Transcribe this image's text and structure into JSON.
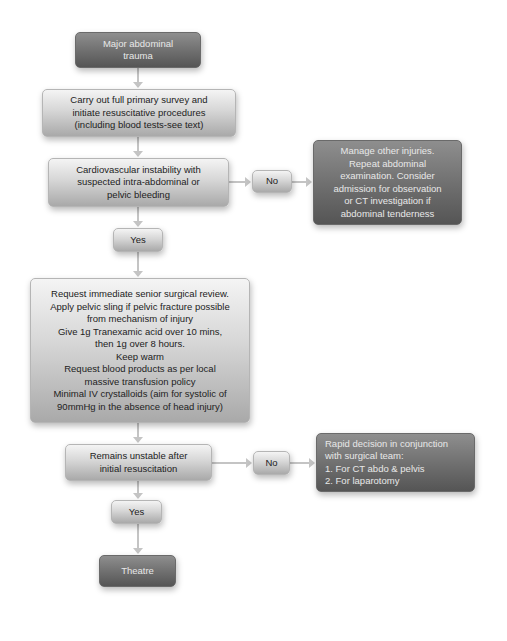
{
  "flowchart": {
    "start": {
      "label": "Major abdominal\ntrauma"
    },
    "primary_survey": {
      "label": "Carry out full primary survey and\ninitiate resuscitative procedures\n(including blood tests-see text)"
    },
    "decision_1": {
      "label": "Cardiovascular instability with\nsuspected intra-abdominal or\npelvic bleeding"
    },
    "decision_1_no": {
      "label": "No"
    },
    "no_path_1": {
      "label": "Manage other injuries.\nRepeat abdominal\nexamination. Consider\nadmission for observation\nor CT investigation if\nabdominal tenderness"
    },
    "decision_1_yes": {
      "label": "Yes"
    },
    "actions": {
      "label": "Request immediate senior surgical review.\nApply pelvic sling if pelvic fracture possible\nfrom mechanism of injury\nGive 1g Tranexamic acid over 10 mins,\nthen 1g over 8 hours.\nKeep warm\nRequest blood products as per local\nmassive transfusion policy\nMinimal IV crystalloids (aim for systolic of\n90mmHg in the absence of head injury)"
    },
    "decision_2": {
      "label": "Remains unstable after\ninitial resuscitation"
    },
    "decision_2_no": {
      "label": "No"
    },
    "no_path_2": {
      "label": "Rapid decision in conjunction\nwith surgical team:\n1.  For CT abdo & pelvis\n2.  For laparotomy"
    },
    "decision_2_yes": {
      "label": "Yes"
    },
    "end": {
      "label": "Theatre"
    }
  },
  "colors": {
    "dark_box": "#6e6e6e",
    "light_box": "#d6d6d6",
    "connector": "#c4c4c4"
  }
}
